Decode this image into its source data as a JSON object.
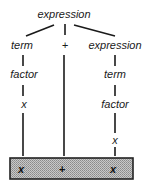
{
  "tree": {
    "root": "expression",
    "children": [
      {
        "label": "term",
        "chain": [
          "term",
          "factor",
          "x"
        ]
      },
      {
        "label": "+",
        "chain": [
          "+"
        ]
      },
      {
        "label": "expression",
        "chain": [
          "expression",
          "term",
          "factor",
          "x"
        ]
      }
    ]
  },
  "nodes": {
    "root": "expression",
    "left_term": "term",
    "left_factor": "factor",
    "left_x": "x",
    "plus": "+",
    "right_expression": "expression",
    "right_term": "term",
    "right_factor": "factor",
    "right_x": "x"
  },
  "tokens": [
    "x",
    "+",
    "x"
  ],
  "colors": {
    "ink": "#1a1a1a",
    "token_box_fill": "#b5b5b5",
    "token_box_border": "#222222"
  }
}
